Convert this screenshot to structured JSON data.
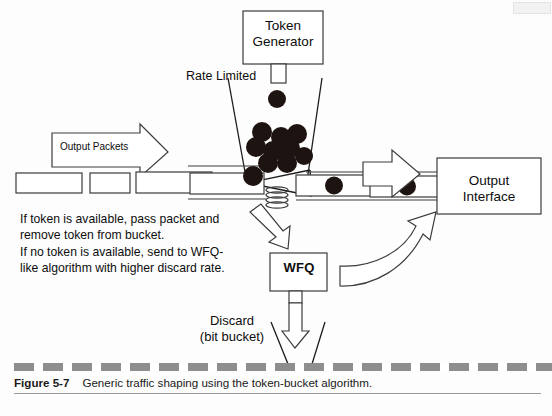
{
  "figure": {
    "number": "Figure 5-7",
    "caption": "Generic traffic shaping using the token-bucket algorithm."
  },
  "labels": {
    "token_generator": "Token\nGenerator",
    "rate_limited": "Rate Limited",
    "output_packets": "Output Packets",
    "output_interface": "Output\nInterface",
    "wfq": "WFQ",
    "discard": "Discard\n(bit bucket)",
    "rule": "If token is available, pass packet and\nremove token from bucket.\nIf no token is available, send to WFQ-\nlike algorithm with higher discard rate."
  },
  "colors": {
    "token": "#1d1310",
    "stroke": "#1a1a1a",
    "line": "#404040",
    "caption_dash": "#8e8e8e",
    "background": "#fdfdfd"
  },
  "diagram": {
    "bucket": {
      "left_wall": [
        [
          228,
          78
        ],
        [
          247,
          183
        ]
      ],
      "right_wall": [
        [
          322,
          78
        ],
        [
          307,
          181
        ]
      ]
    },
    "tokens_in_bucket": [
      {
        "cx": 256,
        "cy": 147,
        "r": 10
      },
      {
        "cx": 273,
        "cy": 151,
        "r": 10
      },
      {
        "cx": 290,
        "cy": 148,
        "r": 10
      },
      {
        "cx": 303,
        "cy": 156,
        "r": 9
      },
      {
        "cx": 297,
        "cy": 134,
        "r": 10
      },
      {
        "cx": 281,
        "cy": 137,
        "r": 10
      },
      {
        "cx": 262,
        "cy": 132,
        "r": 10
      },
      {
        "cx": 268,
        "cy": 163,
        "r": 10
      },
      {
        "cx": 287,
        "cy": 163,
        "r": 10
      },
      {
        "cx": 253,
        "cy": 175,
        "r": 10
      }
    ],
    "falling_token": {
      "cx": 277,
      "cy": 99,
      "r": 9
    },
    "packet_tokens": [
      {
        "cx": 334,
        "cy": 185,
        "r": 9
      },
      {
        "cx": 407,
        "cy": 186,
        "r": 9
      }
    ],
    "packets_left": [
      {
        "x": 16,
        "y": 173,
        "w": 66,
        "h": 20
      },
      {
        "x": 90,
        "y": 173,
        "w": 40,
        "h": 20
      },
      {
        "x": 136,
        "y": 172,
        "w": 76,
        "h": 21
      },
      {
        "x": 190,
        "y": 173,
        "w": 74,
        "h": 21
      }
    ],
    "packets_right": [
      {
        "x": 296,
        "y": 175,
        "w": 76,
        "h": 21
      },
      {
        "x": 370,
        "y": 176,
        "w": 68,
        "h": 21
      }
    ],
    "boxes": {
      "token_generator": {
        "x": 243,
        "y": 11,
        "w": 80,
        "h": 53
      },
      "token_chute": {
        "x": 271,
        "y": 64,
        "w": 15,
        "h": 19
      },
      "output_interface": {
        "x": 437,
        "y": 158,
        "w": 104,
        "h": 56
      },
      "wfq": {
        "x": 270,
        "y": 253,
        "w": 57,
        "h": 38
      },
      "wfq_chute": {
        "x": 289,
        "y": 291,
        "w": 13,
        "h": 12
      }
    }
  }
}
